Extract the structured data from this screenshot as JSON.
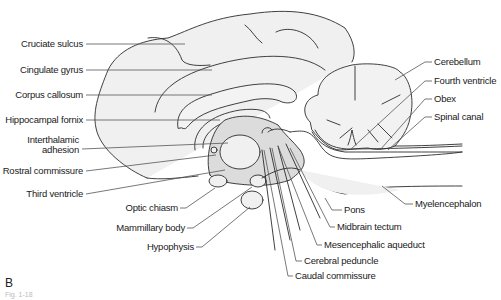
{
  "figure": {
    "panel_letter": "B",
    "caption_partial": "Fig. 1-18",
    "colors": {
      "outline": "#2b2b2b",
      "fill_light": "#f0f0f0",
      "fill_mid": "#dedede",
      "leader": "#555555",
      "label_text": "#1a1a1a"
    },
    "labels_left": [
      {
        "text": "Cruciate sulcus"
      },
      {
        "text": "Cingulate gyrus"
      },
      {
        "text": "Corpus callosum"
      },
      {
        "text": "Hippocampal fornix"
      },
      {
        "text": "Interthalamic",
        "text2": "adhesion"
      },
      {
        "text": "Rostral commissure"
      },
      {
        "text": "Third ventricle"
      }
    ],
    "labels_bottom": [
      {
        "text": "Optic chiasm"
      },
      {
        "text": "Mammillary body"
      },
      {
        "text": "Hypophysis"
      },
      {
        "text": "Pons"
      },
      {
        "text": "Midbrain tectum"
      },
      {
        "text": "Mesencephalic aqueduct"
      },
      {
        "text": "Cerebral peduncle"
      },
      {
        "text": "Caudal commissure"
      }
    ],
    "labels_right": [
      {
        "text": "Cerebellum"
      },
      {
        "text": "Fourth ventricle"
      },
      {
        "text": "Obex"
      },
      {
        "text": "Spinal canal"
      },
      {
        "text": "Myelencephalon"
      }
    ]
  }
}
